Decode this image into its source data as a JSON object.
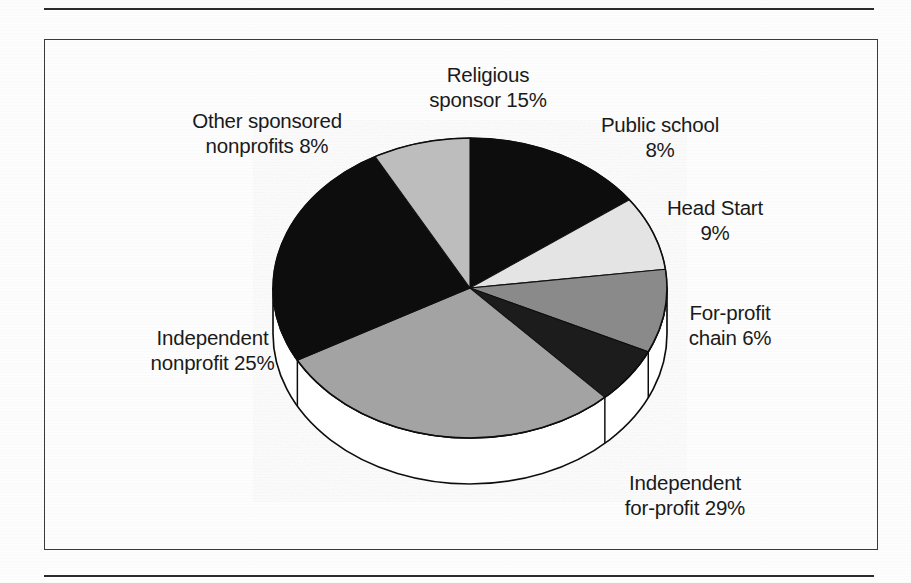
{
  "figure": {
    "frame": {
      "border_color": "#3a3a3a",
      "rule_color": "#2b2b2b"
    },
    "background": "#ffffff"
  },
  "chart_data": {
    "type": "pie",
    "title": "",
    "subtitle": "",
    "xlabel": "",
    "ylabel": "",
    "legend_position": "none",
    "grid": false,
    "style": "3d-exploded-disc",
    "total": 100,
    "units": "percent",
    "start_angle_deg": 0,
    "direction": "clockwise",
    "categories": [
      "Religious sponsor",
      "Public school",
      "Head Start",
      "For-profit chain",
      "Independent for-profit",
      "Independent nonprofit",
      "Other sponsored nonprofits"
    ],
    "values": [
      15,
      8,
      9,
      6,
      29,
      25,
      8
    ],
    "slices": [
      {
        "label_line1": "Religious",
        "label_line2": "sponsor 15%",
        "name": "Religious sponsor",
        "value": 15,
        "color": "#0d0d0d"
      },
      {
        "label_line1": "Public school",
        "label_line2": "8%",
        "name": "Public school",
        "value": 8,
        "color": "#e4e4e4"
      },
      {
        "label_line1": "Head Start",
        "label_line2": "9%",
        "name": "Head Start",
        "value": 9,
        "color": "#8a8a8a"
      },
      {
        "label_line1": "For-profit",
        "label_line2": "chain 6%",
        "name": "For-profit chain",
        "value": 6,
        "color": "#1f1f1f"
      },
      {
        "label_line1": "Independent",
        "label_line2": "for-profit 29%",
        "name": "Independent for-profit",
        "value": 29,
        "color": "#a3a3a3"
      },
      {
        "label_line1": "Independent",
        "label_line2": "nonprofit 25%",
        "name": "Independent nonprofit",
        "value": 25,
        "color": "#0d0d0d"
      },
      {
        "label_line1": "Other sponsored",
        "label_line2": "nonprofits 8%",
        "name": "Other sponsored nonprofits",
        "value": 8,
        "color": "#bdbdbd"
      }
    ],
    "colors": [
      "#0d0d0d",
      "#e4e4e4",
      "#8a8a8a",
      "#1f1f1f",
      "#a3a3a3",
      "#0d0d0d",
      "#bdbdbd"
    ],
    "geometry": {
      "center_x": 470,
      "center_y": 288,
      "radius_x": 197,
      "radius_y": 150,
      "depth": 46
    }
  }
}
